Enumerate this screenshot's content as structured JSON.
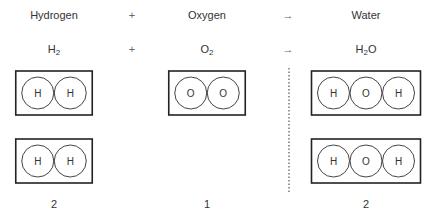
{
  "row_names": {
    "reactant1": "Hydrogen",
    "plus": "+",
    "reactant2": "Oxygen",
    "arrow": "→",
    "product": "Water"
  },
  "row_formulas": {
    "reactant1": {
      "base": "H",
      "sub": "2",
      "tail": ""
    },
    "plus": "+",
    "reactant2": {
      "base": "O",
      "sub": "2",
      "tail": ""
    },
    "arrow": "→",
    "product": {
      "base": "H",
      "sub": "2",
      "tail": "O"
    }
  },
  "molecules": {
    "hydrogen": [
      [
        "H",
        "H"
      ],
      [
        "H",
        "H"
      ]
    ],
    "oxygen": [
      [
        "O",
        "O"
      ]
    ],
    "water": [
      [
        "H",
        "O",
        "H"
      ],
      [
        "H",
        "O",
        "H"
      ]
    ]
  },
  "counts": {
    "hydrogen": "2",
    "oxygen": "1",
    "water": "2"
  }
}
